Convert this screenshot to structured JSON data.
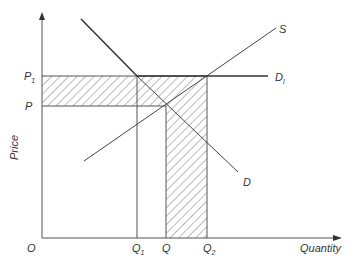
{
  "diagram": {
    "type": "supply-demand",
    "axes": {
      "y_label": "Price",
      "x_label": "Quantity",
      "origin_label": "O"
    },
    "price_ticks": [
      {
        "label": "P",
        "sub": "1",
        "name": "P1"
      },
      {
        "label": "P",
        "sub": "",
        "name": "P"
      }
    ],
    "quantity_ticks": [
      {
        "label": "Q",
        "sub": "1",
        "name": "Q1"
      },
      {
        "label": "Q",
        "sub": "",
        "name": "Q"
      },
      {
        "label": "Q",
        "sub": "2",
        "name": "Q2"
      }
    ],
    "curves": {
      "supply": {
        "label": "S"
      },
      "demand": {
        "label": "D"
      },
      "demand_1": {
        "label": "D",
        "sub": "l"
      }
    },
    "shaded_regions": [
      "horizontal band between P and P1 from O to Q2",
      "vertical band between Q and Q2 from 0 to P1"
    ],
    "colors": {
      "line": "#444444",
      "hatch": "#555555",
      "background": "#ffffff"
    }
  }
}
